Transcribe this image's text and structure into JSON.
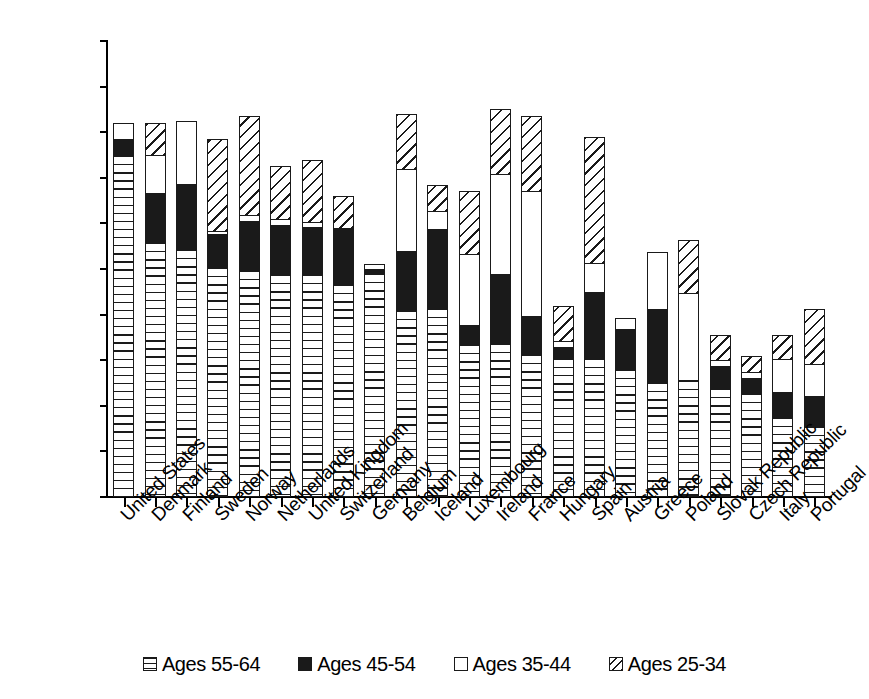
{
  "chart_data": {
    "type": "bar",
    "stacked": true,
    "title": "",
    "subtitle": "",
    "xlabel": "",
    "ylabel": "",
    "ylim": [
      0,
      50
    ],
    "ytick_step": 5,
    "ytick_labels": [
      "0",
      "5",
      "10",
      "15",
      "20",
      "25",
      "30",
      "35",
      "40",
      "45",
      "50"
    ],
    "grid": false,
    "legend_position": "bottom",
    "categories": [
      "United States",
      "Denmark",
      "Finland",
      "Sweden",
      "Norway",
      "Netherlands",
      "United Kingdom",
      "Switzerland",
      "Germany",
      "Belgium",
      "Iceland",
      "Luxembourg",
      "Ireland",
      "France",
      "Hungary",
      "Spain",
      "Austria",
      "Greece",
      "Poland",
      "Slovak Republic",
      "Czech Republic",
      "Italy",
      "Portugal"
    ],
    "series": [
      {
        "name": "Ages 55-64",
        "pattern": "horizontal-lines",
        "values": [
          37.5,
          28.0,
          27.2,
          25.2,
          24.9,
          24.5,
          24.4,
          23.4,
          24.6,
          20.5,
          20.7,
          16.8,
          16.9,
          15.7,
          15.2,
          15.2,
          14.0,
          12.6,
          12.8,
          11.9,
          11.4,
          8.8,
          7.8
        ]
      },
      {
        "name": "Ages 45-54",
        "pattern": "solid-black",
        "values": [
          1.8,
          5.3,
          7.1,
          3.6,
          5.4,
          5.3,
          5.2,
          6.1,
          0.4,
          6.5,
          8.7,
          2.1,
          7.5,
          4.1,
          1.3,
          7.3,
          4.4,
          8.0,
          0.0,
          2.5,
          1.7,
          2.7,
          3.3
        ]
      },
      {
        "name": "Ages 35-44",
        "pattern": "white",
        "values": [
          1.7,
          4.2,
          6.9,
          0.4,
          0.6,
          0.7,
          0.6,
          0.0,
          0.5,
          9.0,
          2.0,
          7.7,
          11.0,
          13.8,
          0.6,
          3.2,
          1.2,
          6.3,
          9.6,
          0.6,
          0.6,
          3.6,
          3.5
        ]
      },
      {
        "name": "Ages 25-34",
        "pattern": "diagonal-lines",
        "values": [
          0.0,
          3.5,
          0.0,
          10.1,
          10.9,
          5.8,
          6.8,
          3.5,
          0.0,
          6.0,
          2.8,
          7.0,
          7.1,
          8.2,
          3.9,
          13.8,
          0.0,
          0.0,
          5.8,
          2.8,
          1.8,
          2.7,
          6.0
        ]
      }
    ],
    "totals": [
      41.0,
      41.0,
      41.2,
      39.3,
      41.8,
      36.3,
      37.0,
      33.0,
      25.5,
      42.0,
      34.2,
      33.6,
      42.5,
      41.8,
      21.0,
      39.5,
      19.6,
      26.9,
      28.2,
      17.8,
      15.5,
      17.8,
      20.6
    ]
  },
  "legend": {
    "items": [
      {
        "label": "Ages 55-64",
        "pattern": "horizontal-lines"
      },
      {
        "label": "Ages 45-54",
        "pattern": "solid-black"
      },
      {
        "label": "Ages 35-44",
        "pattern": "white"
      },
      {
        "label": "Ages 25-34",
        "pattern": "diagonal-lines"
      }
    ]
  },
  "colors": {
    "ink": "#1a1a1a",
    "background": "#ffffff"
  }
}
